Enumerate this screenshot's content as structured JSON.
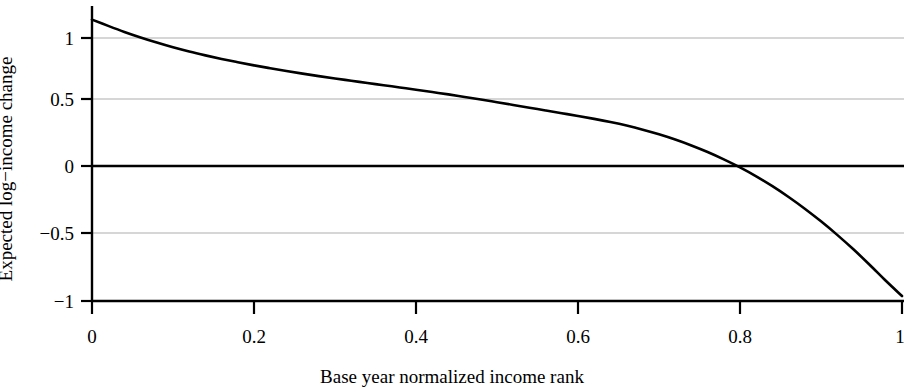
{
  "chart_data": {
    "type": "line",
    "title": "",
    "xlabel": "Base year normalized income rank",
    "ylabel": "Expected log−income change",
    "xlim": [
      0,
      1
    ],
    "ylim": [
      -1,
      1.18
    ],
    "xticks": [
      0,
      0.2,
      0.4,
      0.6,
      0.8,
      1
    ],
    "xtick_labels": [
      "0",
      "0.2",
      "0.4",
      "0.6",
      "0.8",
      "1"
    ],
    "yticks": [
      -1,
      -0.5,
      0,
      0.5,
      1
    ],
    "ytick_labels": [
      "−1",
      "−0.5",
      "0",
      "0.5",
      "1"
    ],
    "grid": true,
    "grid_y_values": [
      1,
      0.5,
      -0.5
    ],
    "zero_line": 0,
    "legend": null,
    "series": [
      {
        "name": "Expected log-income change",
        "color": "#000000",
        "line_width": 2.6,
        "x": [
          0.0,
          0.02,
          0.04,
          0.06,
          0.08,
          0.1,
          0.12,
          0.14,
          0.16,
          0.18,
          0.2,
          0.22,
          0.24,
          0.26,
          0.28,
          0.3,
          0.32,
          0.34,
          0.36,
          0.38,
          0.4,
          0.42,
          0.44,
          0.46,
          0.48,
          0.5,
          0.52,
          0.54,
          0.56,
          0.58,
          0.6,
          0.62,
          0.64,
          0.66,
          0.68,
          0.7,
          0.72,
          0.74,
          0.76,
          0.78,
          0.8,
          0.82,
          0.84,
          0.86,
          0.88,
          0.9,
          0.92,
          0.94,
          0.96,
          0.98,
          1.0
        ],
        "y": [
          1.14,
          1.092,
          1.046,
          1.004,
          0.965,
          0.929,
          0.897,
          0.868,
          0.841,
          0.816,
          0.792,
          0.77,
          0.749,
          0.729,
          0.71,
          0.692,
          0.675,
          0.658,
          0.641,
          0.624,
          0.607,
          0.589,
          0.571,
          0.552,
          0.533,
          0.512,
          0.491,
          0.47,
          0.449,
          0.428,
          0.407,
          0.385,
          0.361,
          0.334,
          0.303,
          0.268,
          0.228,
          0.183,
          0.133,
          0.077,
          0.016,
          -0.052,
          -0.127,
          -0.209,
          -0.298,
          -0.394,
          -0.497,
          -0.607,
          -0.724,
          -0.846,
          -0.962
        ]
      }
    ]
  },
  "axes": {
    "y_tick_0": "1",
    "y_tick_1": "0.5",
    "y_tick_2": "0",
    "y_tick_3": "−0.5",
    "y_tick_4": "−1",
    "x_tick_0": "0",
    "x_tick_1": "0.2",
    "x_tick_2": "0.4",
    "x_tick_3": "0.6",
    "x_tick_4": "0.8",
    "x_tick_5": "1",
    "y_axis_title": "Expected log−income change",
    "x_axis_title": "Base year normalized income rank"
  },
  "colors": {
    "line": "#000000",
    "grid": "#c9c9c9",
    "axis": "#000000",
    "background": "#ffffff"
  }
}
